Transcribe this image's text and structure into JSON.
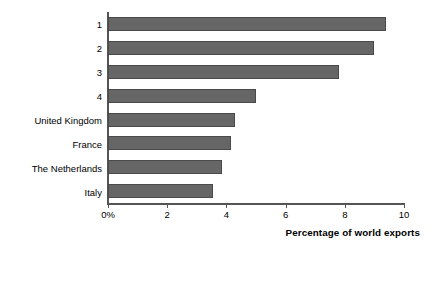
{
  "chart_data": {
    "type": "bar",
    "orientation": "horizontal",
    "title": "",
    "xlabel": "Percentage of world exports",
    "ylabel": "",
    "categories": [
      "1",
      "2",
      "3",
      "4",
      "United Kingdom",
      "France",
      "The Netherlands",
      "Italy"
    ],
    "values": [
      9.4,
      9.0,
      7.8,
      5.0,
      4.3,
      4.15,
      3.85,
      3.55
    ],
    "series": [
      {
        "name": "Percentage of world exports",
        "values": [
          9.4,
          9.0,
          7.8,
          5.0,
          4.3,
          4.15,
          3.85,
          3.55
        ]
      }
    ],
    "xlim": [
      0,
      10
    ],
    "xticks": [
      0,
      2,
      4,
      6,
      8,
      10
    ],
    "xtick_labels": [
      "0%",
      "2",
      "4",
      "6",
      "8",
      "10"
    ],
    "grid": false,
    "legend": false,
    "bar_color": "#666666",
    "bar_edge_color": "#4a4a4a",
    "axis_color": "#555555",
    "background_color": "#ffffff"
  }
}
